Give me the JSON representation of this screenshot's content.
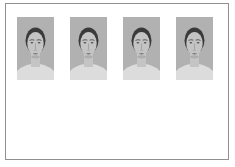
{
  "page": {
    "background": "#ffffff"
  },
  "frame": {
    "background": "#ffffff",
    "border_color": "#909090"
  },
  "colors": {
    "page_bg": "#ffffff",
    "frame_bg": "#ffffff",
    "frame_border": "#909090",
    "face_bg": "#b1b1b1",
    "face_hair": "#3a3a3a",
    "face_skin": "#c4c4c4",
    "face_chest": "#dcdcdc",
    "face_feature": "#4f4f4f",
    "face_shadow": "#9a9a9a"
  },
  "faces": [
    {
      "name": "face-stimulus-1",
      "label": "female face portrait 1"
    },
    {
      "name": "face-stimulus-2",
      "label": "female face portrait 2"
    },
    {
      "name": "face-stimulus-3",
      "label": "female face portrait 3"
    },
    {
      "name": "face-stimulus-4",
      "label": "female face portrait 4"
    }
  ]
}
